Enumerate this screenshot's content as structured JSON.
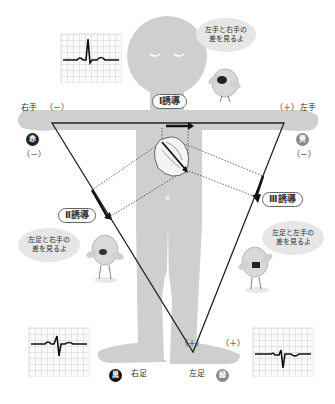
{
  "labels": {
    "right_hand": "右手",
    "left_hand": "左手",
    "right_foot": "右足",
    "left_foot": "左足",
    "right_hand_polarity": "（－）",
    "right_hand_polarity_lower": "（－）",
    "left_hand_polarity": "（＋）",
    "left_hand_polarity_lower": "（－）",
    "left_foot_polarity_left": "（＋）",
    "left_foot_polarity_right": "（＋）"
  },
  "electrodes": {
    "right_hand": {
      "text": "赤",
      "color": "#222222"
    },
    "left_hand": {
      "text": "黄",
      "color": "#8a8a8a"
    },
    "right_foot": {
      "text": "黒",
      "color": "#111111"
    },
    "left_foot": {
      "text": "緑",
      "color": "#8a8a8a"
    }
  },
  "leads": {
    "lead1": "Ⅰ誘導",
    "lead2": "Ⅱ誘導",
    "lead3": "Ⅲ誘導"
  },
  "bubbles": {
    "lead1": {
      "line1": "左手と右手の",
      "line2": "差を見るよ"
    },
    "lead2": {
      "line1": "左足と右手の",
      "line2": "差を見るよ"
    },
    "lead3": {
      "line1": "左足と左手の",
      "line2": "差を見るよ"
    }
  },
  "center_mark": "×",
  "ecg_waveforms": [
    {
      "name": "lead1-ecg",
      "shape": "tall-positive-R"
    },
    {
      "name": "lead2-ecg",
      "shape": "biphasic-small"
    },
    {
      "name": "lead3-ecg",
      "shape": "negative-deflection"
    }
  ],
  "colors": {
    "body": "#cfcfcf",
    "line": "#222222",
    "bubble": "#e6e6e6"
  }
}
